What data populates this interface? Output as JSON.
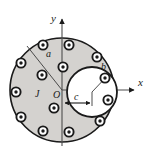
{
  "colors": {
    "conductor_fill": "#d4d2cf",
    "cavity_fill": "#ffffff",
    "stroke": "#1a1a1a",
    "page_background": "#ffffff"
  },
  "labels": {
    "axis_y": "y",
    "axis_x": "x",
    "origin": "O",
    "outer_radius": "a",
    "cavity_radius": "b",
    "offset": "c",
    "current_density": "J"
  },
  "geometry": {
    "origin": {
      "x": 62,
      "y": 90
    },
    "outer_circle": {
      "cx": 62,
      "cy": 90,
      "r": 52
    },
    "cavity_circle": {
      "cx": 92,
      "cy": 92,
      "r": 25
    },
    "axis_y": {
      "x": 62,
      "y_top": 17,
      "y_bottom": 146
    },
    "axis_x": {
      "y": 90,
      "x_left": 62,
      "x_right": 138
    },
    "radius_leader": {
      "x1": 62,
      "y1": 90,
      "x2": 27,
      "y2": 46
    },
    "cavity_radius_leader": {
      "x1": 92,
      "y1": 92,
      "x2": 110,
      "y2": 73
    },
    "offset_arrow": {
      "x1": 65,
      "y1": 103,
      "x2": 92,
      "y2": 103
    },
    "cavity_center_tick": {
      "x": 92,
      "y_top": 92,
      "y_bottom": 106
    }
  },
  "current_dots": {
    "symbol_name": "current-out-of-page-dot",
    "outer_radius": 4.6,
    "inner_radius": 1.7,
    "count": 14,
    "positions": [
      {
        "x": 43,
        "y": 45
      },
      {
        "x": 69,
        "y": 45
      },
      {
        "x": 21,
        "y": 63
      },
      {
        "x": 63,
        "y": 67
      },
      {
        "x": 97,
        "y": 57
      },
      {
        "x": 42,
        "y": 75
      },
      {
        "x": 16,
        "y": 92
      },
      {
        "x": 54,
        "y": 108
      },
      {
        "x": 21,
        "y": 117
      },
      {
        "x": 100,
        "y": 121
      },
      {
        "x": 43,
        "y": 131
      },
      {
        "x": 69,
        "y": 132
      },
      {
        "x": 108,
        "y": 100
      },
      {
        "x": 105,
        "y": 78
      }
    ]
  },
  "label_positions": {
    "axis_y": {
      "x": 51,
      "y": 22
    },
    "axis_x": {
      "x": 138,
      "y": 86
    },
    "origin": {
      "x": 53,
      "y": 98
    },
    "outer_radius": {
      "x": 46,
      "y": 57
    },
    "cavity_radius": {
      "x": 101,
      "y": 70
    },
    "offset": {
      "x": 74,
      "y": 100
    },
    "current_density": {
      "x": 35,
      "y": 97
    }
  }
}
